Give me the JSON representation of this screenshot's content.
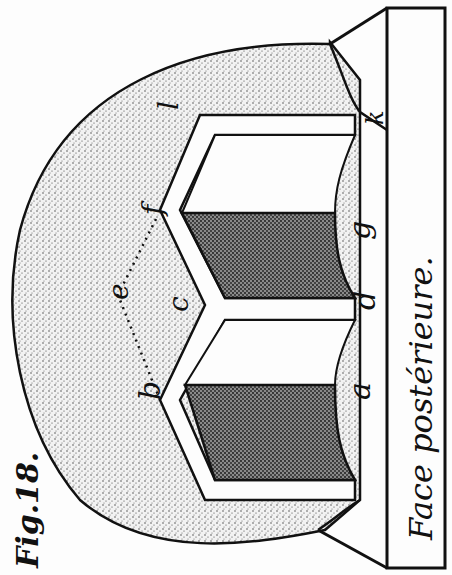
{
  "figure": {
    "title": "Fig.18.",
    "caption": "Face postérieure.",
    "orientation": "rotated 90° counter-clockwise",
    "labels": {
      "a": "a",
      "b": "b",
      "c": "c",
      "d": "d",
      "e": "e",
      "f": "f",
      "g": "g",
      "k": "k",
      "l": "l"
    },
    "colors": {
      "ink": "#111111",
      "paper": "#fdfdfd",
      "stipple_light": "#c8c8c8",
      "stipple_dark": "#5a5a5a"
    }
  }
}
